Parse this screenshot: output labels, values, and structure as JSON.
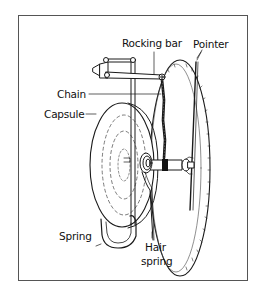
{
  "diagram": {
    "colors": {
      "line": "#1a1a1a",
      "frame": "#555555",
      "background": "#ffffff"
    },
    "labels": {
      "rocking_bar": "Rocking bar",
      "pointer": "Pointer",
      "chain": "Chain",
      "capsule": "Capsule",
      "spring": "Spring",
      "hair_spring_line1": "Hair",
      "hair_spring_line2": "spring"
    }
  }
}
